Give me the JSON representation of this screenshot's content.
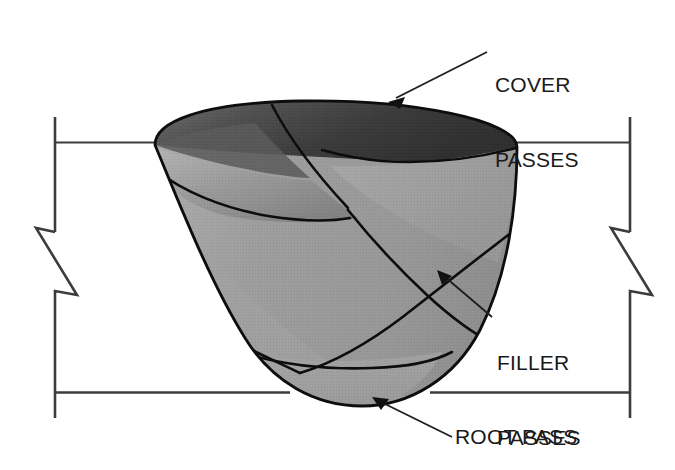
{
  "diagram": {
    "type": "technical-illustration",
    "colors": {
      "cover_pass_fill": "#4a4a4a",
      "filler_pass_fill": "#9e9e9e",
      "root_pass_fill": "#a0a0a0",
      "outline": "#0d0d0d",
      "base_metal_line": "#3c3c3c",
      "label_text": "#1a1a1a",
      "background": "#ffffff"
    },
    "labels": {
      "cover": "COVER\nPASSES",
      "cover_line1": "COVER",
      "cover_line2": "PASSES",
      "filler": "FILLER\nPASSES",
      "filler_line1": "FILLER",
      "filler_line2": "PASSES",
      "root": "ROOT PASS"
    },
    "annotations": [
      {
        "name": "cover-passes-callout",
        "text": "COVER PASSES",
        "arrow_from": [
          487,
          52
        ],
        "arrow_to": [
          390,
          100
        ]
      },
      {
        "name": "filler-passes-callout",
        "text": "FILLER PASSES",
        "arrow_from": [
          492,
          317
        ],
        "arrow_to": [
          438,
          272
        ]
      },
      {
        "name": "root-pass-callout",
        "text": "ROOT PASS",
        "arrow_from": [
          452,
          437
        ],
        "arrow_to": [
          372,
          398
        ]
      }
    ],
    "base_metal": {
      "top_surface_y": 142,
      "bottom_surface_y": 392,
      "left_edge_x": 55,
      "right_edge_x": 630,
      "break_symbol_left": true,
      "break_symbol_right": true
    },
    "weld": {
      "left_toe_x": 155,
      "right_toe_x": 517,
      "crown_y": 103,
      "root_bottom_y": 406,
      "pass_count_visible": 7
    }
  }
}
